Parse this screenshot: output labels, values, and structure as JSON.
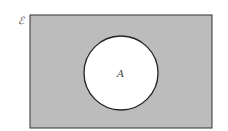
{
  "diagram": {
    "type": "venn",
    "universal_set_label": "ℰ",
    "sets": [
      {
        "label": "A",
        "shaded": false
      }
    ],
    "shaded_region": "complement of A (A')",
    "colors": {
      "shade": "#bcbcbc",
      "circle_fill": "#ffffff",
      "stroke": "#222222"
    }
  }
}
